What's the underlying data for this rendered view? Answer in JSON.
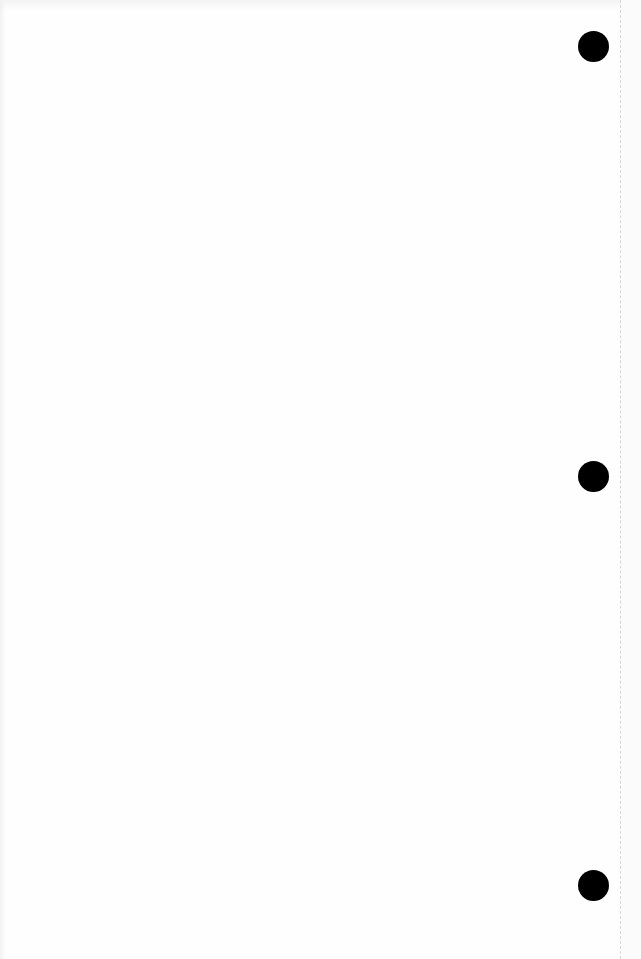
{
  "document": {
    "type": "blank scanned page",
    "background_color": "#fefefe",
    "punch_holes": [
      {
        "id": "hole-top",
        "cx": 593,
        "cy": 46,
        "diameter": 31,
        "color": "#000000"
      },
      {
        "id": "hole-middle",
        "cx": 593,
        "cy": 476,
        "diameter": 31,
        "color": "#000000"
      },
      {
        "id": "hole-bottom",
        "cx": 593,
        "cy": 885,
        "diameter": 31,
        "color": "#000000"
      }
    ],
    "edge_line": {
      "x": 620,
      "style": "dashed",
      "color": "#d6d6d6"
    }
  }
}
